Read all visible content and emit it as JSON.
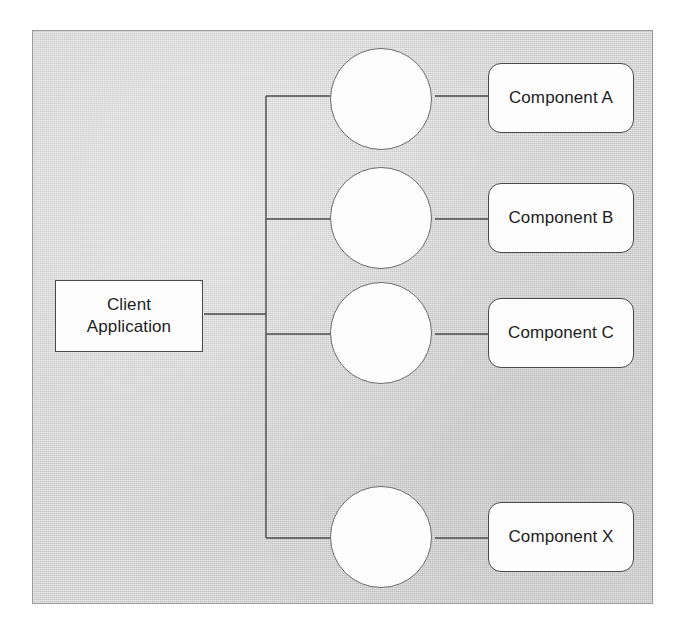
{
  "diagram": {
    "type": "component-interface-diagram",
    "background_color": "#d6d6d6",
    "node_fill_color": "#fdfdfd",
    "line_color": "#4a4a4a",
    "text_color": "#1d1d1d",
    "client": {
      "label": "Client\nApplication",
      "shape": "rectangle"
    },
    "interfaces": [
      {
        "name": "interface-a",
        "shape": "circle",
        "label": ""
      },
      {
        "name": "interface-b",
        "shape": "circle",
        "label": ""
      },
      {
        "name": "interface-c",
        "shape": "circle",
        "label": ""
      },
      {
        "name": "interface-x",
        "shape": "circle",
        "label": ""
      }
    ],
    "components": [
      {
        "label": "Component A",
        "shape": "rounded-rectangle"
      },
      {
        "label": "Component B",
        "shape": "rounded-rectangle"
      },
      {
        "label": "Component C",
        "shape": "rounded-rectangle"
      },
      {
        "label": "Component X",
        "shape": "rounded-rectangle"
      }
    ]
  }
}
